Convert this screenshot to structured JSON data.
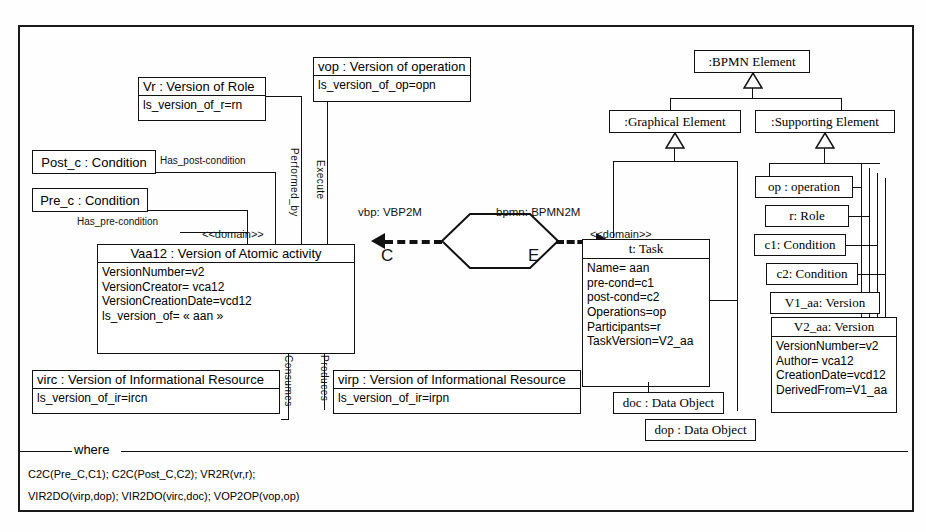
{
  "diagram": {
    "transformation": {
      "left_label": "vbp: VBP2M",
      "right_label": "bpmn: BPMN2M",
      "left_marker": "C",
      "right_marker": "E"
    },
    "source_model": {
      "vr_box": {
        "header": "Vr : Version of Role",
        "attributes": [
          "ls_version_of_r=rn"
        ]
      },
      "vop_box": {
        "header": "vop : Version of operation",
        "attributes": [
          "ls_version_of_op=opn"
        ]
      },
      "post_c_box": {
        "header": "Post_c : Condition"
      },
      "pre_c_box": {
        "header": "Pre_c : Condition"
      },
      "vaa12_box": {
        "stereotype": "<<domain>>",
        "header": "Vaa12 : Version of Atomic activity",
        "attributes": [
          "VersionNumber=v2",
          "VersionCreator= vca12",
          "VersionCreationDate=vcd12",
          "ls_version_of= « aan »"
        ]
      },
      "virc_box": {
        "header": "virc : Version of Informational Resource",
        "attributes": [
          "ls_version_of_ir=ircn"
        ]
      },
      "virp_box": {
        "header": "virp : Version of Informational Resource",
        "attributes": [
          "ls_version_of_ir=irpn"
        ]
      },
      "associations": {
        "has_post_condition": "Has_post-condition",
        "has_pre_condition": "Has_pre-condition",
        "performed_by": "Performed_by",
        "execute": "Execute",
        "consumes": "Consumes",
        "produces": "Produces"
      }
    },
    "target_model": {
      "bpmn_element": ":BPMN Element",
      "graphical_element": ":Graphical Element",
      "supporting_element": ":Supporting Element",
      "task_box": {
        "stereotype": "<<domain>>",
        "header": "t: Task",
        "attributes": [
          "Name= aan",
          "pre-cond=c1",
          "post-cond=c2",
          "Operations=op",
          "Participants=r",
          "TaskVersion=V2_aa"
        ]
      },
      "doc_box": {
        "header": "doc : Data Object"
      },
      "dop_box": {
        "header": "dop : Data Object"
      },
      "op_box": {
        "header": "op : operation"
      },
      "r_box": {
        "header": "r: Role"
      },
      "c1_box": {
        "header": "c1: Condition"
      },
      "c2_box": {
        "header": "c2: Condition"
      },
      "v1_aa_box": {
        "header": "V1_aa: Version"
      },
      "v2_aa_box": {
        "header": "V2_aa: Version",
        "attributes": [
          "VersionNumber=v2",
          "Author= vca12",
          "CreationDate=vcd12",
          "DerivedFrom=V1_aa"
        ]
      }
    },
    "where_clause": {
      "label": "where",
      "lines": [
        "C2C(Pre_C,C1); C2C(Post_C,C2);   VR2R(vr,r);",
        "VIR2DO(virp,dop);  VIR2DO(virc,doc);  VOP2OP(vop,op)"
      ]
    }
  }
}
